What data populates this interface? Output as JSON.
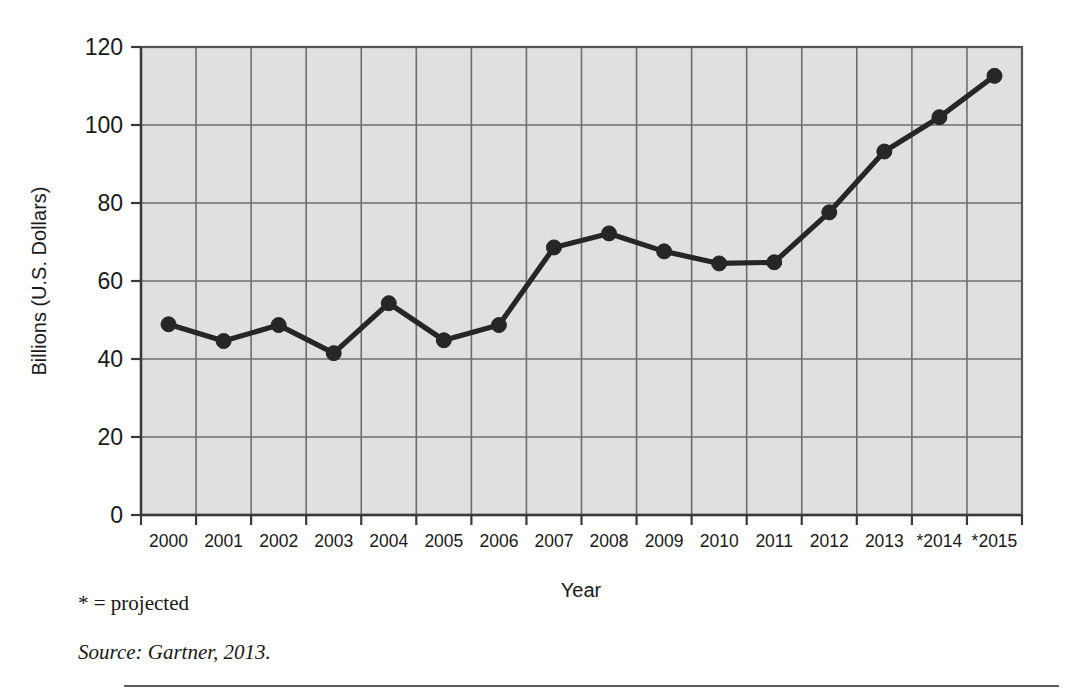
{
  "chart_data": {
    "type": "line",
    "title": "",
    "xlabel": "Year",
    "ylabel": "Billions (U.S. Dollars)",
    "categories": [
      "2000",
      "2001",
      "2002",
      "2003",
      "2004",
      "2005",
      "2006",
      "2007",
      "2008",
      "2009",
      "2010",
      "2011",
      "2012",
      "2013",
      "*2014",
      "*2015"
    ],
    "values": [
      48.9,
      44.6,
      48.7,
      41.5,
      54.3,
      44.8,
      48.7,
      68.6,
      72.2,
      67.6,
      64.5,
      64.8,
      77.6,
      93.2,
      102.0,
      112.6
    ],
    "series": [
      {
        "name": "Spending",
        "values": [
          48.9,
          44.6,
          48.7,
          41.5,
          54.3,
          44.8,
          48.7,
          68.6,
          72.2,
          67.6,
          64.5,
          64.8,
          77.6,
          93.2,
          102.0,
          112.6
        ]
      }
    ],
    "y_ticks": [
      0,
      20,
      40,
      60,
      80,
      100,
      120
    ],
    "ylim": [
      0,
      120
    ],
    "grid": true,
    "legend": "none",
    "marker": "circle",
    "line_color": "#262626",
    "marker_color": "#262626",
    "plot_background": "#e0e0e0",
    "grid_color": "#6e6e6e"
  },
  "footnotes": {
    "projected": "* = projected",
    "source": "Source: Gartner, 2013."
  }
}
